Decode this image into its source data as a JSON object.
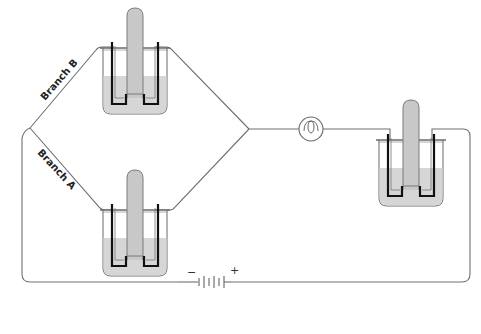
{
  "diagram": {
    "title": "",
    "labels": {
      "branch_b": "Branch B",
      "branch_a": "Branch A",
      "battery_negative": "−",
      "battery_positive": "+"
    },
    "components": [
      {
        "id": "cell-branch-b",
        "type": "electrolytic cell (beaker with inverted collection tube and two electrodes)"
      },
      {
        "id": "cell-branch-a",
        "type": "electrolytic cell (beaker with inverted collection tube and two electrodes)"
      },
      {
        "id": "cell-series",
        "type": "electrolytic cell (beaker with inverted collection tube and two electrodes)"
      },
      {
        "id": "lamp",
        "type": "light bulb"
      },
      {
        "id": "battery",
        "type": "battery (multi-cell)"
      }
    ],
    "colors": {
      "wire": "#707070",
      "liquid": "#d6d6d6",
      "tube": "#c8c8c8",
      "electrode": "#111111",
      "beaker_outline": "#666666"
    }
  }
}
